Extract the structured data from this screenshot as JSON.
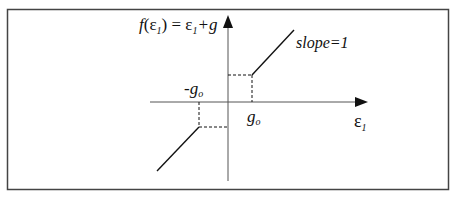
{
  "diagram": {
    "function_label": {
      "f": "f",
      "open": "(",
      "eps": "ε",
      "sub1": "1",
      "close": ")",
      "eq": " = ",
      "eps2": "ε",
      "sub2": "1",
      "plus_g": "+g"
    },
    "slope_label": "slope=1",
    "neg_go_label": {
      "minus": "-",
      "g": "g",
      "sub": "o"
    },
    "go_label": {
      "g": "g",
      "sub": "o"
    },
    "x_axis_label": {
      "eps": "ε",
      "sub": "1"
    },
    "colors": {
      "line": "#111111",
      "axis": "#555555",
      "frame": "#444444"
    }
  }
}
